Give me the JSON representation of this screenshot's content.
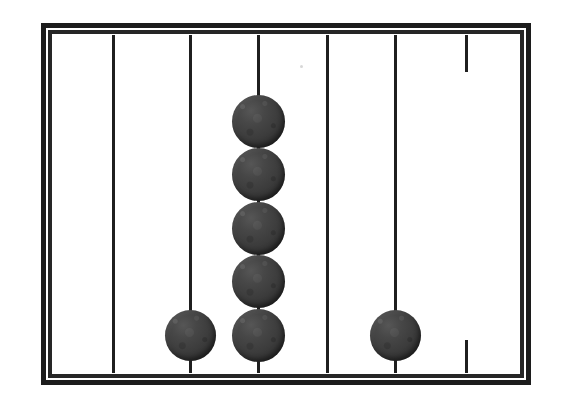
{
  "figure": {
    "canvas": {
      "width": 572,
      "height": 416
    },
    "colors": {
      "background": "#ffffff",
      "frame_outer": "#1c1c1c",
      "frame_inner": "#262626",
      "rod": "#1f1f1f",
      "bead": "#3c3c3c",
      "bead_highlight": "#565656",
      "bead_shadow": "#272727"
    }
  },
  "frame": {
    "label": "abacus-frame",
    "outer": {
      "x": 41,
      "y": 23,
      "width": 490,
      "height": 362,
      "border_width": 5
    },
    "inner": {
      "x": 48,
      "y": 30,
      "width": 476,
      "height": 348,
      "border_width": 4
    },
    "field": {
      "x": 53,
      "y": 35,
      "width": 466,
      "height": 338
    }
  },
  "rods": [
    {
      "id": 1,
      "name": "rod-1",
      "x": 113,
      "top": 35,
      "bottom": 373,
      "width": 3,
      "broken": false,
      "bead_count": 0
    },
    {
      "id": 2,
      "name": "rod-2",
      "x": 190,
      "top": 35,
      "bottom": 373,
      "width": 3,
      "broken": false,
      "bead_count": 1
    },
    {
      "id": 3,
      "name": "rod-3",
      "x": 258,
      "top": 35,
      "bottom": 373,
      "width": 3,
      "broken": false,
      "bead_count": 5
    },
    {
      "id": 4,
      "name": "rod-4",
      "x": 327,
      "top": 35,
      "bottom": 373,
      "width": 3,
      "broken": false,
      "bead_count": 0
    },
    {
      "id": 5,
      "name": "rod-5",
      "x": 395,
      "top": 35,
      "bottom": 373,
      "width": 3,
      "broken": false,
      "bead_count": 1
    },
    {
      "id": 6,
      "name": "rod-6",
      "x": 466,
      "top": 35,
      "bottom": 373,
      "width": 3,
      "broken": true,
      "bead_count": 0,
      "segments": [
        {
          "name": "rod-6-top-stub",
          "top": 35,
          "bottom": 72
        },
        {
          "name": "rod-6-bottom-stub",
          "top": 340,
          "bottom": 373
        }
      ]
    }
  ],
  "beads": [
    {
      "name": "bead-rod3-1",
      "rod": 3,
      "index": 1,
      "cx": 258,
      "cy": 121,
      "d": 53
    },
    {
      "name": "bead-rod3-2",
      "rod": 3,
      "index": 2,
      "cx": 258,
      "cy": 174,
      "d": 53
    },
    {
      "name": "bead-rod3-3",
      "rod": 3,
      "index": 3,
      "cx": 258,
      "cy": 228,
      "d": 53
    },
    {
      "name": "bead-rod3-4",
      "rod": 3,
      "index": 4,
      "cx": 258,
      "cy": 281,
      "d": 53
    },
    {
      "name": "bead-rod3-5",
      "rod": 3,
      "index": 5,
      "cx": 258,
      "cy": 335,
      "d": 53
    },
    {
      "name": "bead-rod2-1",
      "rod": 2,
      "index": 1,
      "cx": 190,
      "cy": 335,
      "d": 51
    },
    {
      "name": "bead-rod5-1",
      "rod": 5,
      "index": 1,
      "cx": 395,
      "cy": 335,
      "d": 51
    }
  ],
  "artifacts": [
    {
      "name": "scan-speck",
      "x": 300,
      "y": 65
    }
  ],
  "counts": {
    "rod_total": 6,
    "bead_total": 7,
    "beads_per_rod": [
      0,
      1,
      5,
      0,
      1,
      0
    ]
  }
}
